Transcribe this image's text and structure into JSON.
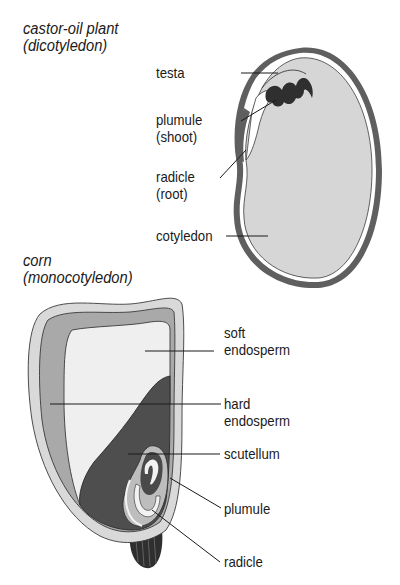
{
  "diagrams": [
    {
      "title_line1": "castor-oil plant",
      "title_line2": "(dicotyledon)",
      "labels": {
        "testa": "testa",
        "plumule_line1": "plumule",
        "plumule_line2": "(shoot)",
        "radicle_line1": "radicle",
        "radicle_line2": "(root)",
        "cotyledon": "cotyledon"
      }
    },
    {
      "title_line1": "corn",
      "title_line2": "(monocotyledon)",
      "labels": {
        "soft_endosperm_line1": "soft",
        "soft_endosperm_line2": "endosperm",
        "hard_endosperm_line1": "hard",
        "hard_endosperm_line2": "endosperm",
        "scutellum": "scutellum",
        "plumule": "plumule",
        "radicle": "radicle"
      }
    }
  ],
  "colors": {
    "seed_coat": "#5f5f5f",
    "cotyledon_fill": "#d6d6d6",
    "corn_outer": "#d9d9d9",
    "corn_pericarp": "#a9a9a9",
    "soft_endosperm": "#efefef",
    "hard_endosperm": "#4e4e4e",
    "embryo_light": "#f2f2f2",
    "ink": "#1a1a1a"
  }
}
